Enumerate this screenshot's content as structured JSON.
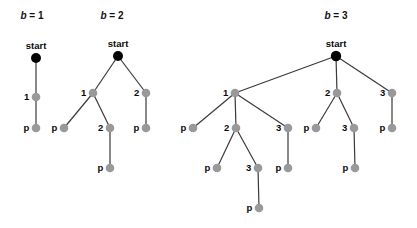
{
  "figure": {
    "width": 417,
    "height": 228,
    "background": "#ffffff",
    "edge_color": "#3a3a3a",
    "start_node_color": "#050505",
    "node_color": "#999999",
    "label_color": "#0a0a0a",
    "start_label": "start"
  },
  "panels": [
    {
      "id": "panel-b1",
      "title": "b = 1",
      "title_x": 32,
      "title_y": 19,
      "nodes": [
        {
          "id": "b1-start",
          "label": "start",
          "type": "start",
          "x": 36,
          "y": 58,
          "r": 5.0,
          "label_pos": "above"
        },
        {
          "id": "b1-n1",
          "label": "1",
          "type": "node",
          "x": 36,
          "y": 97,
          "r": 4.3,
          "label_pos": "left"
        },
        {
          "id": "b1-p1",
          "label": "p",
          "type": "node",
          "x": 36,
          "y": 128,
          "r": 4.3,
          "label_pos": "left"
        }
      ],
      "edges": [
        {
          "from": "b1-start",
          "to": "b1-n1"
        },
        {
          "from": "b1-n1",
          "to": "b1-p1"
        }
      ]
    },
    {
      "id": "panel-b2",
      "title": "b = 2",
      "title_x": 112,
      "title_y": 19,
      "nodes": [
        {
          "id": "b2-start",
          "label": "start",
          "type": "start",
          "x": 118,
          "y": 56,
          "r": 5.0,
          "label_pos": "above"
        },
        {
          "id": "b2-n1",
          "label": "1",
          "type": "node",
          "x": 93,
          "y": 93,
          "r": 4.3,
          "label_pos": "left"
        },
        {
          "id": "b2-n2",
          "label": "2",
          "type": "node",
          "x": 146,
          "y": 93,
          "r": 4.3,
          "label_pos": "left"
        },
        {
          "id": "b2-p1",
          "label": "p",
          "type": "node",
          "x": 64,
          "y": 128,
          "r": 4.3,
          "label_pos": "left"
        },
        {
          "id": "b2-n3",
          "label": "2",
          "type": "node",
          "x": 110,
          "y": 128,
          "r": 4.3,
          "label_pos": "left"
        },
        {
          "id": "b2-p2",
          "label": "p",
          "type": "node",
          "x": 146,
          "y": 128,
          "r": 4.3,
          "label_pos": "left"
        },
        {
          "id": "b2-p3",
          "label": "p",
          "type": "node",
          "x": 110,
          "y": 168,
          "r": 4.3,
          "label_pos": "left"
        }
      ],
      "edges": [
        {
          "from": "b2-start",
          "to": "b2-n1"
        },
        {
          "from": "b2-start",
          "to": "b2-n2"
        },
        {
          "from": "b2-n1",
          "to": "b2-p1"
        },
        {
          "from": "b2-n1",
          "to": "b2-n3"
        },
        {
          "from": "b2-n2",
          "to": "b2-p2"
        },
        {
          "from": "b2-n3",
          "to": "b2-p3"
        }
      ]
    },
    {
      "id": "panel-b3",
      "title": "b = 3",
      "title_x": 336,
      "title_y": 19,
      "nodes": [
        {
          "id": "b3-start",
          "label": "start",
          "type": "start",
          "x": 336,
          "y": 56,
          "r": 5.2,
          "label_pos": "above"
        },
        {
          "id": "b3-n1",
          "label": "1",
          "type": "node",
          "x": 235,
          "y": 93,
          "r": 4.3,
          "label_pos": "left"
        },
        {
          "id": "b3-n2",
          "label": "2",
          "type": "node",
          "x": 337,
          "y": 93,
          "r": 4.3,
          "label_pos": "left"
        },
        {
          "id": "b3-n3",
          "label": "3",
          "type": "node",
          "x": 392,
          "y": 93,
          "r": 4.3,
          "label_pos": "left"
        },
        {
          "id": "b3-1p",
          "label": "p",
          "type": "node",
          "x": 193,
          "y": 128,
          "r": 4.3,
          "label_pos": "left"
        },
        {
          "id": "b3-1n2",
          "label": "2",
          "type": "node",
          "x": 236,
          "y": 128,
          "r": 4.3,
          "label_pos": "left"
        },
        {
          "id": "b3-1n3",
          "label": "3",
          "type": "node",
          "x": 288,
          "y": 128,
          "r": 4.3,
          "label_pos": "left"
        },
        {
          "id": "b3-1n2p",
          "label": "p",
          "type": "node",
          "x": 217,
          "y": 168,
          "r": 4.3,
          "label_pos": "left"
        },
        {
          "id": "b3-1n2n3",
          "label": "3",
          "type": "node",
          "x": 258,
          "y": 168,
          "r": 4.3,
          "label_pos": "left"
        },
        {
          "id": "b3-1n2n3p",
          "label": "p",
          "type": "node",
          "x": 259,
          "y": 208,
          "r": 4.3,
          "label_pos": "left"
        },
        {
          "id": "b3-1n3p",
          "label": "p",
          "type": "node",
          "x": 288,
          "y": 168,
          "r": 4.3,
          "label_pos": "left"
        },
        {
          "id": "b3-2p",
          "label": "p",
          "type": "node",
          "x": 316,
          "y": 128,
          "r": 4.3,
          "label_pos": "left"
        },
        {
          "id": "b3-2n3",
          "label": "3",
          "type": "node",
          "x": 354,
          "y": 128,
          "r": 4.3,
          "label_pos": "left"
        },
        {
          "id": "b3-2n3p",
          "label": "p",
          "type": "node",
          "x": 355,
          "y": 168,
          "r": 4.3,
          "label_pos": "left"
        },
        {
          "id": "b3-3p",
          "label": "p",
          "type": "node",
          "x": 392,
          "y": 128,
          "r": 4.3,
          "label_pos": "left"
        }
      ],
      "edges": [
        {
          "from": "b3-start",
          "to": "b3-n1"
        },
        {
          "from": "b3-start",
          "to": "b3-n2"
        },
        {
          "from": "b3-start",
          "to": "b3-n3"
        },
        {
          "from": "b3-n1",
          "to": "b3-1p"
        },
        {
          "from": "b3-n1",
          "to": "b3-1n2"
        },
        {
          "from": "b3-n1",
          "to": "b3-1n3"
        },
        {
          "from": "b3-1n2",
          "to": "b3-1n2p"
        },
        {
          "from": "b3-1n2",
          "to": "b3-1n2n3"
        },
        {
          "from": "b3-1n2n3",
          "to": "b3-1n2n3p"
        },
        {
          "from": "b3-1n3",
          "to": "b3-1n3p"
        },
        {
          "from": "b3-n2",
          "to": "b3-2p"
        },
        {
          "from": "b3-n2",
          "to": "b3-2n3"
        },
        {
          "from": "b3-2n3",
          "to": "b3-2n3p"
        },
        {
          "from": "b3-n3",
          "to": "b3-3p"
        }
      ]
    }
  ]
}
